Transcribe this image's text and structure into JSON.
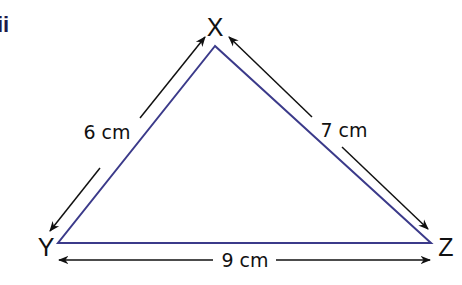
{
  "part_label": "ii",
  "figure": {
    "type": "triangle",
    "vertices": {
      "X": {
        "label": "X"
      },
      "Y": {
        "label": "Y"
      },
      "Z": {
        "label": "Z"
      }
    },
    "sides": {
      "XY": {
        "label": "6 cm",
        "length": 6,
        "unit": "cm"
      },
      "XZ": {
        "label": "7 cm",
        "length": 7,
        "unit": "cm"
      },
      "YZ": {
        "label": "9 cm",
        "length": 9,
        "unit": "cm"
      }
    },
    "colors": {
      "triangle_stroke": "#3b3a8a",
      "arrow_stroke": "#111111",
      "part_label": "#1e1b4b"
    }
  }
}
